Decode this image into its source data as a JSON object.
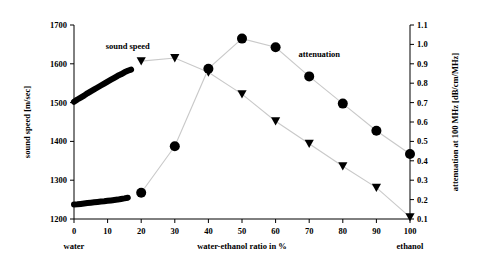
{
  "chart_data": {
    "type": "line",
    "title": "",
    "xlabel": "water-ethanol ratio in %",
    "ylabel": "sound speed [m/sec]",
    "y2label": "attenuation at 100 MHz [dB/cm/MHz]",
    "xlim": [
      0,
      100
    ],
    "ylim": [
      1200,
      1700
    ],
    "y2lim": [
      0.1,
      1.1
    ],
    "xticks": [
      "0",
      "10",
      "20",
      "30",
      "40",
      "50",
      "60",
      "70",
      "80",
      "90",
      "100"
    ],
    "xtick_values": [
      0,
      10,
      20,
      30,
      40,
      50,
      60,
      70,
      80,
      90,
      100
    ],
    "yticks": [
      "1200",
      "1300",
      "1400",
      "1500",
      "1600",
      "1700"
    ],
    "ytick_values": [
      1200,
      1300,
      1400,
      1500,
      1600,
      1700
    ],
    "y2ticks": [
      "0.1",
      "0.2",
      "0.3",
      "0.4",
      "0.5",
      "0.6",
      "0.7",
      "0.8",
      "0.9",
      "1.0",
      "1.1"
    ],
    "y2tick_values": [
      0.1,
      0.2,
      0.3,
      0.4,
      0.5,
      0.6,
      0.7,
      0.8,
      0.9,
      1.0,
      1.1
    ],
    "grid": false,
    "legend_position": "inline-annotations",
    "x_axis_end_labels": {
      "left": "water",
      "right": "ethanol"
    },
    "annotations": [
      {
        "text": "sound speed",
        "x": 16,
        "y": 1638,
        "axis": "left"
      },
      {
        "text": "attenuation",
        "x": 73,
        "y": 1617,
        "axis": "left"
      }
    ],
    "series": [
      {
        "name": "sound speed",
        "axis": "left",
        "units": "m/sec",
        "marker": "triangle-down",
        "color": "#000000",
        "x": [
          20,
          30,
          40,
          50,
          60,
          70,
          80,
          90,
          100
        ],
        "values": [
          1607,
          1615,
          1578,
          1522,
          1452,
          1394,
          1336,
          1281,
          1205
        ]
      },
      {
        "name": "attenuation",
        "axis": "right",
        "units": "dB/cm/MHz",
        "marker": "circle",
        "color": "#000000",
        "x": [
          20,
          30,
          40,
          50,
          60,
          70,
          80,
          90,
          100
        ],
        "values": [
          0.235,
          0.475,
          0.875,
          1.03,
          0.985,
          0.835,
          0.695,
          0.555,
          0.435
        ]
      },
      {
        "name": "sound speed dense measurements",
        "axis": "left",
        "units": "m/sec",
        "marker": "dense-band",
        "color": "#000000",
        "x": [
          0,
          1,
          2,
          3,
          4,
          5,
          6,
          7,
          8,
          9,
          10,
          11,
          12,
          13,
          14,
          15,
          16,
          17
        ],
        "values": [
          1502,
          1508,
          1513,
          1518,
          1524,
          1529,
          1534,
          1539,
          1544,
          1549,
          1554,
          1559,
          1564,
          1569,
          1573,
          1578,
          1582,
          1585
        ]
      },
      {
        "name": "attenuation dense measurements",
        "axis": "right",
        "units": "dB/cm/MHz",
        "marker": "dense-band",
        "color": "#000000",
        "x": [
          0,
          1,
          2,
          3,
          4,
          5,
          6,
          7,
          8,
          9,
          10,
          11,
          12,
          13,
          14,
          15,
          16
        ],
        "values": [
          0.175,
          0.176,
          0.178,
          0.18,
          0.182,
          0.184,
          0.186,
          0.188,
          0.19,
          0.192,
          0.194,
          0.196,
          0.198,
          0.2,
          0.203,
          0.206,
          0.21
        ]
      }
    ]
  }
}
